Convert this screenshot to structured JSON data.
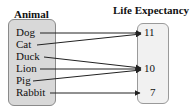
{
  "headers": {
    "domain": "Animal",
    "range": "Life Expectancy"
  },
  "domain_items": [
    {
      "label": "Dog"
    },
    {
      "label": "Cat"
    },
    {
      "label": "Duck"
    },
    {
      "label": "Lion"
    },
    {
      "label": "Pig"
    },
    {
      "label": "Rabbit"
    }
  ],
  "range_items": [
    {
      "label": "11"
    },
    {
      "label": "10"
    },
    {
      "label": "7"
    }
  ],
  "mapping": [
    {
      "from": "Dog",
      "to": "11"
    },
    {
      "from": "Cat",
      "to": "11"
    },
    {
      "from": "Duck",
      "to": "10"
    },
    {
      "from": "Lion",
      "to": "10"
    },
    {
      "from": "Pig",
      "to": "10"
    },
    {
      "from": "Rabbit",
      "to": "7"
    }
  ],
  "colors": {
    "domain_box_fill": "#d8d8d8",
    "range_box_fill": "#f1f1f1",
    "arrow": "#222222"
  }
}
